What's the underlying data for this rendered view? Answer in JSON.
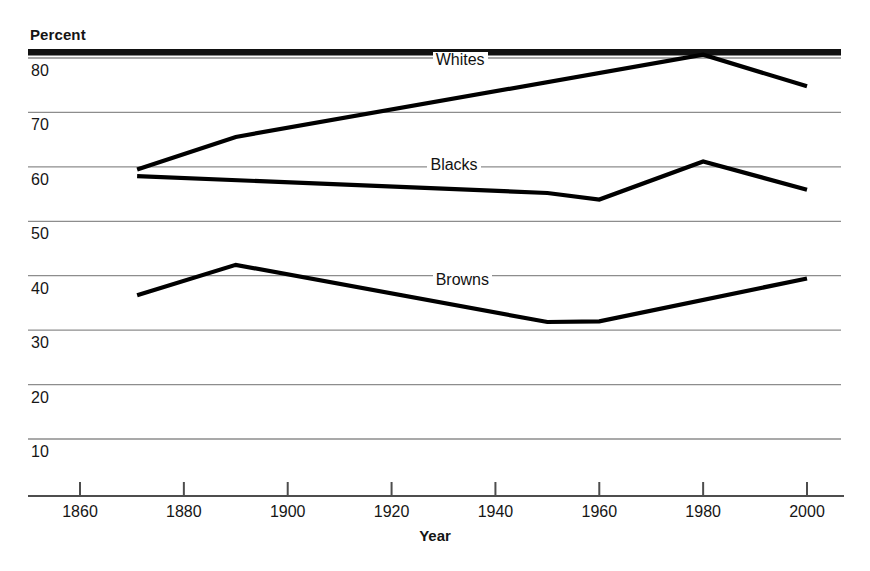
{
  "chart_data": {
    "type": "line",
    "title": "",
    "xlabel": "Year",
    "ylabel": "Percent",
    "xlim": [
      1851,
      2010
    ],
    "ylim": [
      3,
      84
    ],
    "grid": true,
    "legend_position": "inline-labels",
    "x_ticks": [
      1860,
      1880,
      1900,
      1920,
      1940,
      1960,
      1980,
      2000
    ],
    "x_tick_labels": [
      "1860",
      "1880",
      "1900",
      "1920",
      "1940",
      "1960",
      "1980",
      "2000"
    ],
    "y_ticks": [
      10,
      20,
      30,
      40,
      50,
      60,
      70,
      80
    ],
    "y_tick_labels": [
      "10",
      "20",
      "30",
      "40",
      "50",
      "60",
      "70",
      "80"
    ],
    "series": [
      {
        "name": "Whites",
        "x": [
          1871,
          1890,
          1980,
          2000
        ],
        "values": [
          59.5,
          65.5,
          80.6,
          74.8
        ],
        "color": "#000000"
      },
      {
        "name": "Blacks",
        "x": [
          1871,
          1950,
          1960,
          1980,
          2000
        ],
        "values": [
          58.3,
          55.2,
          54.0,
          61.0,
          55.8
        ],
        "color": "#000000"
      },
      {
        "name": "Browns",
        "x": [
          1871,
          1890,
          1950,
          1960,
          2000
        ],
        "values": [
          36.4,
          42.0,
          31.5,
          31.6,
          39.5
        ],
        "color": "#000000"
      }
    ],
    "annotations": [
      {
        "text": "Whites",
        "x": 1936,
        "y": 79.2
      },
      {
        "text": "Blacks",
        "x": 1935,
        "y": 60.0
      },
      {
        "text": "Browns",
        "x": 1936,
        "y": 38.8
      }
    ]
  },
  "axes": {
    "y_axis_title": "Percent",
    "x_axis_title": "Year"
  },
  "style": {
    "line_color": "#000000",
    "grid_color": "#8d8d8d",
    "top_rule_color": "#111111",
    "axis_color": "#4d4d4d",
    "background": "#ffffff"
  }
}
